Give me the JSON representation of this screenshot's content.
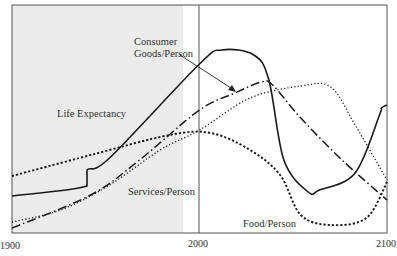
{
  "chart_data": {
    "type": "line",
    "title": "",
    "xlabel": "",
    "ylabel": "",
    "xlim": [
      1900,
      2100
    ],
    "x_ticks": [
      "1900",
      "2000",
      "2100"
    ],
    "shaded_region": [
      1900,
      1990
    ],
    "reference_line_x": 2000,
    "series": [
      {
        "name": "Life Expectancy",
        "style": "solid",
        "points": [
          [
            1900,
            196
          ],
          [
            1940,
            186
          ],
          [
            1940,
            170
          ],
          [
            1952,
            158
          ],
          [
            2000,
            64
          ],
          [
            2012,
            50
          ],
          [
            2029,
            55
          ],
          [
            2037,
            80
          ],
          [
            2045,
            160
          ],
          [
            2058,
            192
          ],
          [
            2064,
            190
          ],
          [
            2083,
            173
          ],
          [
            2096,
            115
          ],
          [
            2097,
            108
          ],
          [
            2100,
            105
          ]
        ]
      },
      {
        "name": "Consumer Goods/Person",
        "style": "dash-dot",
        "points": [
          [
            1900,
            228
          ],
          [
            1942,
            195
          ],
          [
            1968,
            160
          ],
          [
            2000,
            110
          ],
          [
            2019,
            93
          ],
          [
            2033,
            82
          ],
          [
            2039,
            85
          ],
          [
            2054,
            118
          ],
          [
            2076,
            160
          ],
          [
            2100,
            200
          ]
        ]
      },
      {
        "name": "Services/Person",
        "style": "dotted",
        "points": [
          [
            1900,
            222
          ],
          [
            1926,
            210
          ],
          [
            1952,
            185
          ],
          [
            1979,
            150
          ],
          [
            2000,
            130
          ],
          [
            2027,
            98
          ],
          [
            2054,
            86
          ],
          [
            2070,
            87
          ],
          [
            2083,
            125
          ],
          [
            2100,
            180
          ]
        ]
      },
      {
        "name": "Food/Person",
        "style": "dashed",
        "points": [
          [
            1900,
            176
          ],
          [
            1942,
            155
          ],
          [
            1984,
            135
          ],
          [
            2006,
            133
          ],
          [
            2027,
            150
          ],
          [
            2043,
            175
          ],
          [
            2054,
            215
          ],
          [
            2070,
            225
          ],
          [
            2089,
            218
          ],
          [
            2100,
            182
          ]
        ]
      }
    ],
    "annotations": [
      "Life Expectancy",
      "Consumer Goods/Person",
      "Services/Person",
      "Food/Person"
    ]
  },
  "labels": {
    "life": "Life Expectancy",
    "consumer1": "Consumer",
    "consumer2": "Goods/Person",
    "services": "Services/Person",
    "food": "Food/Person",
    "x1900": "1900",
    "x2000": "2000",
    "x2100": "2100"
  }
}
